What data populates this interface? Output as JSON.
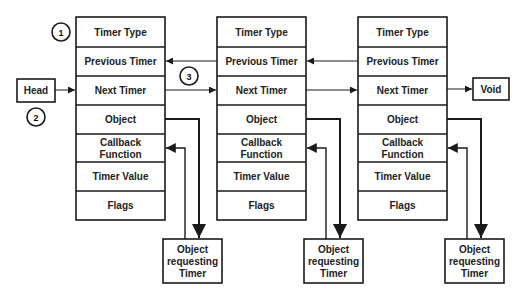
{
  "diagram": {
    "colors": {
      "stroke": "#1a1a1a",
      "fill": "#ffffff",
      "text": "#222222"
    },
    "head_label": "Head",
    "void_label": "Void",
    "callouts": [
      "1",
      "2",
      "3"
    ],
    "timer_fields": [
      "Timer Type",
      "Previous Timer",
      "Next Timer",
      "Object",
      "Callback Function",
      "Timer Value",
      "Flags"
    ],
    "nodes": [
      {
        "fields": {
          "timer_type": "Timer Type",
          "previous_timer": "Previous Timer",
          "next_timer": "Next Timer",
          "object": "Object",
          "callback_line1": "Callback",
          "callback_line2": "Function",
          "timer_value": "Timer Value",
          "flags": "Flags"
        },
        "requester": {
          "line1": "Object",
          "line2": "requesting",
          "line3": "Timer"
        }
      },
      {
        "fields": {
          "timer_type": "Timer Type",
          "previous_timer": "Previous Timer",
          "next_timer": "Next Timer",
          "object": "Object",
          "callback_line1": "Callback",
          "callback_line2": "Function",
          "timer_value": "Timer Value",
          "flags": "Flags"
        },
        "requester": {
          "line1": "Object",
          "line2": "requesting",
          "line3": "Timer"
        }
      },
      {
        "fields": {
          "timer_type": "Timer Type",
          "previous_timer": "Previous Timer",
          "next_timer": "Next Timer",
          "object": "Object",
          "callback_line1": "Callback",
          "callback_line2": "Function",
          "timer_value": "Timer Value",
          "flags": "Flags"
        },
        "requester": {
          "line1": "Object",
          "line2": "requesting",
          "line3": "Timer"
        }
      }
    ]
  }
}
